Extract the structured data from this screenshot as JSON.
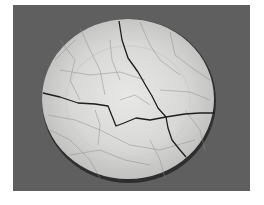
{
  "image": {
    "subject": "cracked crackle-glaze ceramic plate",
    "colors": {
      "border": "#ffffff",
      "background": "#5f5f5f",
      "plate": "#d9d9d7",
      "plate_center": "#e6e6e4",
      "rim_shadow": "#2e2e2e",
      "crack": "#1e1e1e",
      "crackle": "#8c8c8a"
    }
  }
}
